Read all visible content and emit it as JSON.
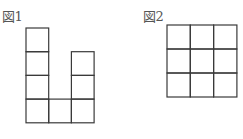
{
  "figures": [
    {
      "label": "図1",
      "description": "Polyomino of 7 unit squares: a column of 4 on the left, a single square at the bottom middle, and a column of 3 on the right",
      "cells": [
        [
          0,
          0
        ],
        [
          0,
          1
        ],
        [
          0,
          2
        ],
        [
          0,
          3
        ],
        [
          1,
          3
        ],
        [
          2,
          1
        ],
        [
          2,
          2
        ],
        [
          2,
          3
        ]
      ]
    },
    {
      "label": "図2",
      "description": "3×3 grid of unit squares",
      "rows": 3,
      "cols": 3
    }
  ],
  "colors": {
    "line": "#3a3a3a",
    "text": "#555555",
    "background": "#ffffff"
  }
}
